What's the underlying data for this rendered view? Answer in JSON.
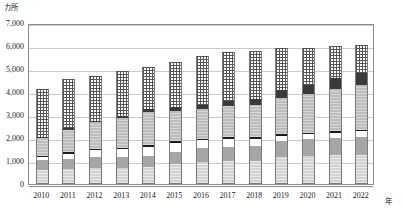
{
  "chart_data": {
    "type": "bar",
    "subtype": "stacked-bar",
    "title": "",
    "xlabel": "年",
    "ylabel": "カ所",
    "y_unit_caption": "カ所",
    "x_unit_caption": "年",
    "ylim": [
      0,
      7000
    ],
    "ytick_values": [
      0,
      1000,
      2000,
      3000,
      4000,
      5000,
      6000,
      7000
    ],
    "ytick_labels": [
      "0",
      "1,000",
      "2,000",
      "3,000",
      "4,000",
      "5,000",
      "6,000",
      "7,000"
    ],
    "grid": true,
    "grid_axis": "y",
    "legend": false,
    "legend_position": "none",
    "categories": [
      "2010",
      "2011",
      "2012",
      "2013",
      "2014",
      "2015",
      "2016",
      "2017",
      "2018",
      "2019",
      "2020",
      "2021",
      "2022"
    ],
    "series": [
      {
        "name": "segment-1",
        "pattern": "light-gray-hatch",
        "color": "#d2d2d2",
        "values": [
          620,
          660,
          700,
          700,
          720,
          850,
          950,
          980,
          990,
          1180,
          1230,
          1240,
          1260
        ]
      },
      {
        "name": "segment-2",
        "pattern": "solid-medium-gray",
        "color": "#a6a6a6",
        "values": [
          420,
          430,
          470,
          480,
          520,
          560,
          600,
          640,
          650,
          700,
          720,
          750,
          790
        ]
      },
      {
        "name": "segment-3",
        "pattern": "solid-white",
        "color": "#ffffff",
        "values": [
          130,
          230,
          290,
          330,
          380,
          380,
          350,
          340,
          330,
          230,
          230,
          240,
          250
        ]
      },
      {
        "name": "segment-4",
        "pattern": "solid-black",
        "color": "#1c1c1c",
        "values": [
          60,
          60,
          60,
          70,
          70,
          70,
          70,
          70,
          70,
          60,
          60,
          60,
          60
        ]
      },
      {
        "name": "segment-5",
        "pattern": "light-gray-speckle",
        "color": "#bdbdbd",
        "values": [
          760,
          990,
          1180,
          1290,
          1460,
          1320,
          1310,
          1350,
          1400,
          1580,
          1680,
          1850,
          1930
        ]
      },
      {
        "name": "segment-6",
        "pattern": "solid-dark-gray",
        "color": "#3a3a3a",
        "values": [
          40,
          50,
          60,
          90,
          130,
          150,
          170,
          230,
          250,
          330,
          390,
          490,
          530
        ]
      },
      {
        "name": "segment-7",
        "pattern": "checkerboard-dots",
        "color": "#565656",
        "values": [
          2120,
          2130,
          1960,
          1940,
          1800,
          1990,
          2100,
          2150,
          2090,
          1840,
          1610,
          1370,
          1230
        ]
      }
    ],
    "totals": [
      4150,
      4550,
      4720,
      4900,
      5080,
      5320,
      5550,
      5760,
      5780,
      5920,
      5920,
      6000,
      6050
    ]
  }
}
